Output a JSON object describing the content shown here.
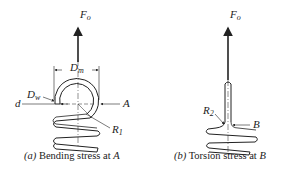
{
  "figure_a": {
    "force_label": "F",
    "force_sub": "o",
    "dim_mean_diameter": "D",
    "dim_mean_diameter_sub": "m",
    "dim_wire_diameter": "D",
    "dim_wire_diameter_sub": "w",
    "dim_d": "d",
    "point": "A",
    "radius_label": "R",
    "radius_sub": "1",
    "caption_prefix": "(a)",
    "caption_text": " Bending stress at ",
    "caption_point": "A"
  },
  "figure_b": {
    "force_label": "F",
    "force_sub": "o",
    "radius_label": "R",
    "radius_sub": "2",
    "point": "B",
    "caption_prefix": "(b)",
    "caption_text": " Torsion stress at ",
    "caption_point": "B"
  },
  "colors": {
    "line": "#222222",
    "background": "#ffffff"
  }
}
